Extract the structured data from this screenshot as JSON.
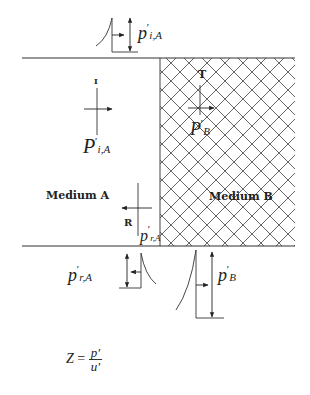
{
  "diagram": {
    "media": {
      "medium_a": {
        "label": "Medium A"
      },
      "medium_b": {
        "label": "Medium B",
        "fill": "hatched"
      }
    },
    "waves": {
      "incident": {
        "marker": "I",
        "pressure_symbol": "P",
        "prime": "'",
        "subscript": "i,A"
      },
      "transmitted": {
        "marker": "T",
        "pressure_symbol": "P",
        "prime": "'",
        "subscript": "B"
      },
      "reflected": {
        "marker": "R",
        "pressure_symbol": "p",
        "prime": "'",
        "subscript": "r,A"
      }
    },
    "pulse_labels": {
      "top_incident": {
        "symbol": "p",
        "prime": "'",
        "subscript": "i,A"
      },
      "bottom_reflected": {
        "symbol": "p",
        "prime": "'",
        "subscript": "r,A"
      },
      "bottom_transmitted": {
        "symbol": "p",
        "prime": "'",
        "subscript": "B"
      }
    },
    "equation": {
      "lhs": "Z",
      "equals": "=",
      "numerator": "p'",
      "denominator": "u'"
    },
    "colors": {
      "line": "#333333",
      "hatch": "#555555",
      "background": "#ffffff"
    }
  }
}
